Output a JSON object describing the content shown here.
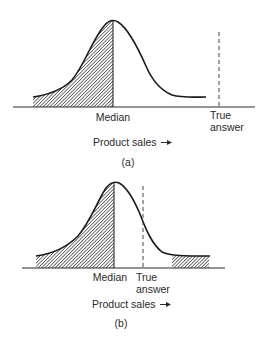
{
  "figure": {
    "panels": [
      {
        "id": "a",
        "caption": "(a)",
        "median_label": "Median",
        "true_answer_label_line1": "True",
        "true_answer_label_line2": "answer",
        "axis_label": "Product sales",
        "axis_arrow": "→",
        "shaded_regions": [
          "left of median"
        ]
      },
      {
        "id": "b",
        "caption": "(b)",
        "median_label": "Median",
        "true_answer_label_line1": "True",
        "true_answer_label_line2": "answer",
        "axis_label": "Product sales",
        "axis_arrow": "→",
        "shaded_regions": [
          "left of median",
          "right tail"
        ]
      }
    ],
    "colors": {
      "line": "#1a1a1a",
      "hatch": "#333333",
      "background": "#ffffff"
    }
  }
}
